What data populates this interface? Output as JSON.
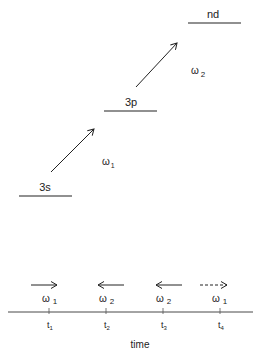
{
  "diagram": {
    "levels": [
      {
        "label": "3s"
      },
      {
        "label": "3p"
      },
      {
        "label": "nd"
      }
    ],
    "transitions": [
      {
        "label": "ω",
        "sub": "1"
      },
      {
        "label": "ω",
        "sub": "2"
      }
    ],
    "timeline": {
      "pulses": [
        {
          "omega": "ω",
          "sub": "1",
          "direction": "right",
          "style": "solid",
          "time": "t",
          "time_sub": "1"
        },
        {
          "omega": "ω",
          "sub": "2",
          "direction": "left",
          "style": "solid",
          "time": "t",
          "time_sub": "2"
        },
        {
          "omega": "ω",
          "sub": "2",
          "direction": "left",
          "style": "solid",
          "time": "t",
          "time_sub": "3"
        },
        {
          "omega": "ω",
          "sub": "1",
          "direction": "right",
          "style": "dashed",
          "time": "t",
          "time_sub": "4"
        }
      ],
      "axis_label": "time"
    }
  }
}
